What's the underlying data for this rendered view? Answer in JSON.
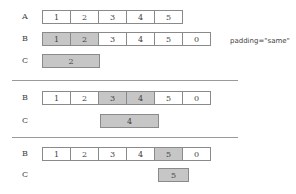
{
  "note": "padding=\"same\"",
  "sections": [
    {
      "rows": [
        {
          "label": "A",
          "cells": [
            "1",
            "2",
            "3",
            "4",
            "5"
          ],
          "highlight": []
        },
        {
          "label": "B",
          "cells": [
            "1",
            "2",
            "3",
            "4",
            "5",
            "0"
          ],
          "highlight": [
            0,
            1
          ]
        }
      ],
      "output": {
        "label": "C",
        "value": "2",
        "start": 0,
        "span": 2
      }
    },
    {
      "rows": [
        {
          "label": "B",
          "cells": [
            "1",
            "2",
            "3",
            "4",
            "5",
            "0"
          ],
          "highlight": [
            2,
            3
          ]
        }
      ],
      "output": {
        "label": "C",
        "value": "4",
        "start": 2,
        "span": 2
      }
    },
    {
      "rows": [
        {
          "label": "B",
          "cells": [
            "1",
            "2",
            "3",
            "4",
            "5",
            "0"
          ],
          "highlight": [
            4
          ]
        }
      ],
      "output": {
        "label": "C",
        "value": "5",
        "start": 4,
        "span": 1
      }
    }
  ]
}
